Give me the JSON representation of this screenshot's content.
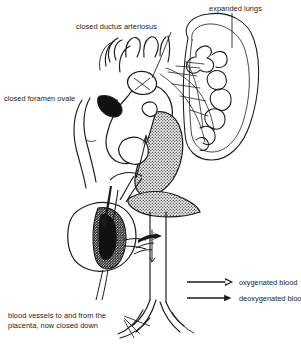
{
  "figure": {
    "type": "anatomical-diagram",
    "background_color": "#ffffff",
    "ink_color": "#1a1a1a",
    "shade_dark_color": "#111111",
    "shade_mid_color": "#8a8a8a"
  },
  "labels": {
    "ductus_arteriosus": "closed ductus arteriosus",
    "expanded_lungs": "expanded lungs",
    "foramen_ovale": "closed foramen ovale",
    "placenta_vessels": "blood vessels to and from the placenta, now closed down"
  },
  "legend": {
    "items": [
      {
        "label": "oxygenated blood",
        "arrow": "open-arrow",
        "fill": "none"
      },
      {
        "label": "deoxygenated  blood",
        "arrow": "solid-arrow",
        "fill": "#1a1a1a"
      }
    ]
  },
  "structures": [
    {
      "name": "heart",
      "shading": "mixed"
    },
    {
      "name": "right-lung",
      "shading": "outline"
    },
    {
      "name": "liver",
      "shading": "stippled-dark"
    },
    {
      "name": "aortic-arch",
      "shading": "outline"
    },
    {
      "name": "descending-aorta",
      "shading": "outline"
    },
    {
      "name": "umbilical-vessels",
      "shading": "outline"
    }
  ]
}
